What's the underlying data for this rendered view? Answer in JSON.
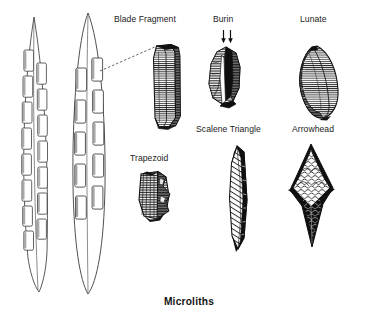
{
  "figure": {
    "caption": "Microliths",
    "background_color": "#ffffff",
    "ink_color": "#1a1a1a",
    "labels": [
      {
        "key": "blade_fragment",
        "text": "Blade Fragment",
        "x": 114,
        "y": 14
      },
      {
        "key": "burin",
        "text": "Burin",
        "x": 213,
        "y": 14
      },
      {
        "key": "lunate",
        "text": "Lunate",
        "x": 300,
        "y": 14
      },
      {
        "key": "scalene_triangle",
        "text": "Scalene Triangle",
        "x": 196,
        "y": 124
      },
      {
        "key": "arrowhead",
        "text": "Arrowhead",
        "x": 292,
        "y": 124
      },
      {
        "key": "trapezoid",
        "text": "Trapezoid",
        "x": 130,
        "y": 153
      }
    ],
    "specimens": [
      {
        "key": "composite_tool_edge_view",
        "label": "",
        "note": "hafted composite tool, narrow edge view with inset microliths"
      },
      {
        "key": "composite_tool_face_view",
        "label": "",
        "note": "hafted composite tool, broad face view with inset microliths"
      },
      {
        "key": "blade_fragment",
        "label": "Blade Fragment"
      },
      {
        "key": "burin",
        "label": "Burin",
        "marks": "two downward arrows indicating burin blow"
      },
      {
        "key": "lunate",
        "label": "Lunate"
      },
      {
        "key": "trapezoid",
        "label": "Trapezoid"
      },
      {
        "key": "scalene_triangle",
        "label": "Scalene Triangle"
      },
      {
        "key": "arrowhead",
        "label": "Arrowhead"
      }
    ],
    "leader_line": {
      "from_x": 100,
      "from_y": 71,
      "to_x": 157,
      "to_y": 46,
      "style": "dashed"
    }
  }
}
